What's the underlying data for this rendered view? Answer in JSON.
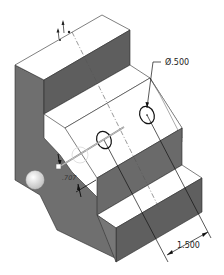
{
  "view": {
    "type": "isometric CAD model view",
    "background": "#ffffff"
  },
  "colors": {
    "face_light": "#ffffff",
    "face_dark": "#6e6e6e",
    "face_mid": "#7a7a7a",
    "face_shadow": "#5e5e5e",
    "edge": "#2a2a2a",
    "centerline": "#555555",
    "dimension": "#111111",
    "manipulator_sphere": "#e6e6e6"
  },
  "annotations": {
    "hole_diameter": "Ø.500",
    "hole_spacing": "1.500",
    "offset_dim": ".707"
  }
}
